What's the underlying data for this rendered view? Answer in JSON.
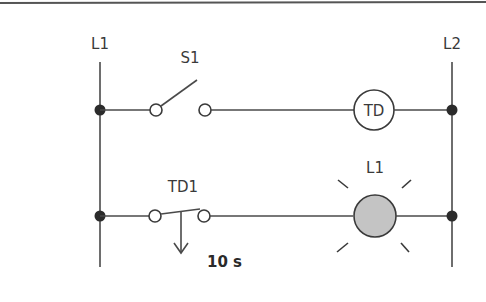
{
  "diagram": {
    "type": "ladder-logic",
    "rails": {
      "left_label": "L1",
      "right_label": "L2"
    },
    "rungs": [
      {
        "index": 1,
        "elements": [
          {
            "kind": "normally-open-switch",
            "label": "S1",
            "state": "open"
          },
          {
            "kind": "timer-coil",
            "label": "TD"
          }
        ]
      },
      {
        "index": 2,
        "elements": [
          {
            "kind": "timed-contact",
            "label": "TD1",
            "delay": "10 s"
          },
          {
            "kind": "lamp",
            "label": "L1",
            "state": "lit"
          }
        ]
      }
    ],
    "colors": {
      "line": "#4a4a4a",
      "node": "#2b2b2b",
      "lamp_fill": "#c4c4c4",
      "background": "#ffffff"
    }
  }
}
